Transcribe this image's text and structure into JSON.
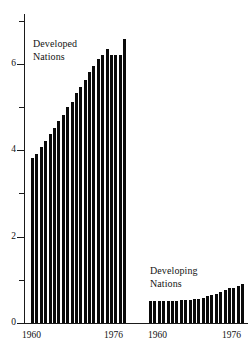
{
  "chart_data": {
    "type": "bar",
    "title": "",
    "subtitle": "",
    "xlabel": "",
    "ylabel": "",
    "ylim": [
      0,
      7
    ],
    "grid": false,
    "legend_position": "inline-annotation",
    "y_ticks_major": [
      0,
      2,
      4,
      6
    ],
    "y_ticks_minor": [
      1,
      3,
      5,
      7
    ],
    "y_tick_labels": [
      "0",
      "2",
      "4",
      "6"
    ],
    "panels": [
      {
        "name": "Developed Nations",
        "label_lines": "Developed\nNations",
        "x_tick_labels": [
          "1960",
          "1976"
        ],
        "x": [
          1960,
          1961,
          1962,
          1963,
          1964,
          1965,
          1966,
          1967,
          1968,
          1969,
          1970,
          1971,
          1972,
          1973,
          1974,
          1975,
          1976,
          1977,
          1978,
          1979,
          1980,
          1981
        ],
        "values": [
          3.82,
          3.92,
          4.08,
          4.22,
          4.38,
          4.52,
          4.68,
          4.82,
          5.0,
          5.12,
          5.32,
          5.46,
          5.62,
          5.82,
          5.94,
          6.1,
          6.2,
          6.34,
          6.2,
          6.2,
          6.2,
          6.58
        ]
      },
      {
        "name": "Developing Nations",
        "label_lines": "Developing\nNations",
        "x_tick_labels": [
          "1960",
          "1976"
        ],
        "x": [
          1960,
          1961,
          1962,
          1963,
          1964,
          1965,
          1966,
          1967,
          1968,
          1969,
          1970,
          1971,
          1972,
          1973,
          1974,
          1975,
          1976,
          1977,
          1978,
          1979,
          1980,
          1981
        ],
        "values": [
          0.5,
          0.5,
          0.51,
          0.51,
          0.52,
          0.52,
          0.52,
          0.53,
          0.53,
          0.54,
          0.55,
          0.55,
          0.58,
          0.62,
          0.64,
          0.68,
          0.72,
          0.76,
          0.8,
          0.82,
          0.86,
          0.9
        ]
      }
    ],
    "colors": {
      "bar": "#0a0a0a",
      "axis": "#1a1a1a",
      "text": "#111111",
      "background": "#ffffff"
    }
  }
}
